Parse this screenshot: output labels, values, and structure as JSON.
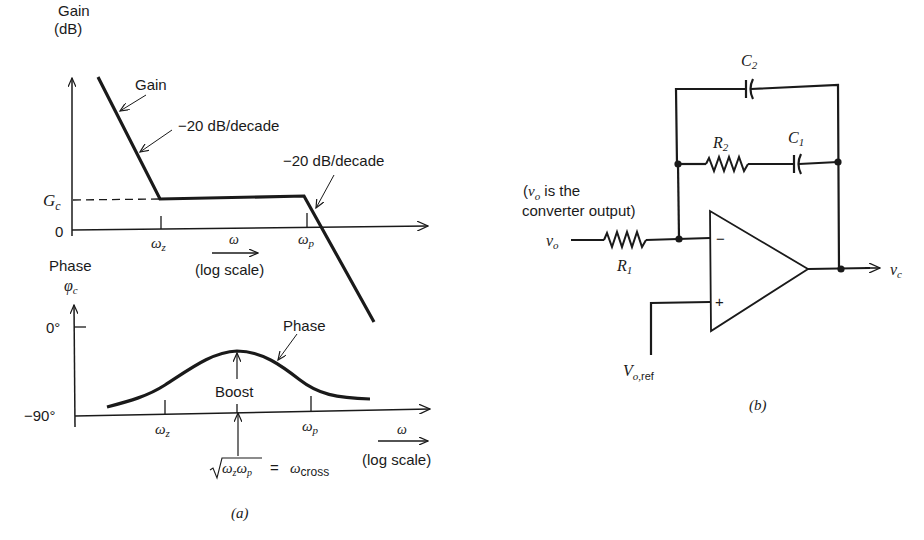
{
  "figure_a": {
    "caption": "(a)",
    "gain_plot": {
      "y_axis_label_line1": "Gain",
      "y_axis_label_line2": "(dB)",
      "curve_label": "Gain",
      "slope_label_low": "−20 dB/decade",
      "slope_label_high": "−20 dB/decade",
      "level_label": "G",
      "level_label_sub": "c",
      "zero_label": "0",
      "tick_zero_label": "ω",
      "tick_zero_sub": "z",
      "tick_pole_label": "ω",
      "tick_pole_sub": "p",
      "x_axis_label": "ω",
      "x_axis_scale": "(log scale)"
    },
    "phase_plot": {
      "y_axis_label_line1": "Phase",
      "y_axis_symbol": "φ",
      "y_axis_symbol_sub": "c",
      "curve_label": "Phase",
      "boost_label": "Boost",
      "tick_0deg": "0°",
      "tick_m90deg": "−90°",
      "tick_zero_label": "ω",
      "tick_zero_sub": "z",
      "tick_pole_label": "ω",
      "tick_pole_sub": "p",
      "cross_formula_lhs": "ω",
      "cross_formula_eq": "=",
      "cross_formula_rhs": "ω",
      "cross_formula_rhs_sub": "cross",
      "x_axis_label": "ω",
      "x_axis_scale": "(log scale)"
    }
  },
  "figure_b": {
    "caption": "(b)",
    "components": {
      "C2": {
        "name": "C",
        "sub": "2"
      },
      "C1": {
        "name": "C",
        "sub": "1"
      },
      "R2": {
        "name": "R",
        "sub": "2"
      },
      "R1": {
        "name": "R",
        "sub": "1"
      }
    },
    "input_label": "v",
    "input_label_sub": "o",
    "input_note_line1_prefix": "(",
    "input_note_line1_var": "v",
    "input_note_line1_sub": "o",
    "input_note_line1_rest": " is the",
    "input_note_line2": "converter output)",
    "output_label": "v",
    "output_label_sub": "c",
    "reference_label": "V",
    "reference_label_sub": "o,",
    "reference_label_sub2": "ref",
    "opamp_minus": "−",
    "opamp_plus": "+"
  },
  "colors": {
    "ink": "#1a1a1a",
    "background": "#ffffff"
  }
}
